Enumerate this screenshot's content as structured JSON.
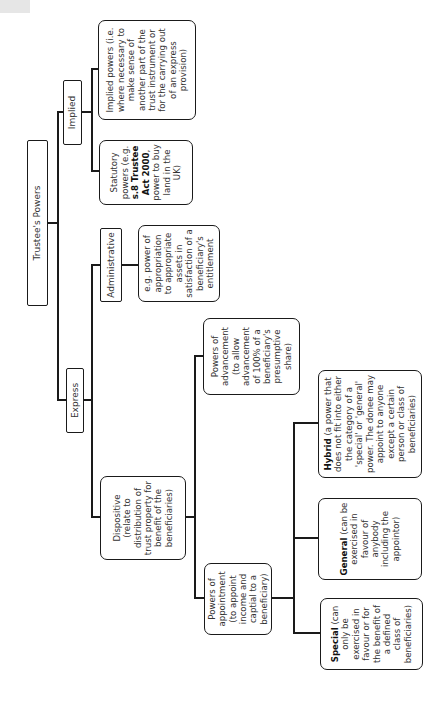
{
  "diagram": {
    "title": "Trustee's Powers",
    "orientation": "rotated -90deg (text reads bottom-to-top)",
    "root": {
      "label": "Trustee's Powers",
      "children": {
        "express": {
          "label": "Express",
          "administrative": {
            "label": "Administrative",
            "detail": "e.g. power of appropriation to appropriate assets in satisfaction of a beneficiary's entitlement"
          },
          "dispositive": {
            "label": "Dispositive (relate to distribution of trust property for benefit of the beneficiaries)",
            "appointment": {
              "label": "Powers of appointment (to appoint income and captial to a beneficiary)",
              "special": {
                "bold": "Special",
                "rest": " (can only be exercised in favour or for the benefit of a defined class of beneficiaries)"
              },
              "general": {
                "bold": "General",
                "rest": " (can be exercised in favour of anybody including the appointor)"
              },
              "hybrid": {
                "bold": "Hybrid",
                "rest": " (a power that does not fit into either the category of a 'special' or 'general' power. The donee may appoint to anyone except a certain person or class of beneficiaries)"
              }
            },
            "advancement": {
              "label": "Powers of advancement (to allow advancement of 100% of a beneficiary's presumptive share)"
            }
          }
        },
        "implied": {
          "label": "Implied",
          "statutory": {
            "pre": "Statutory powers (e.g. ",
            "bold": "s.8 Trustee Act 2000",
            "post": ", power to buy land in the UK)"
          },
          "implied_detail": "Implied powers (i.e. where necessary to make sense of another part of the trust instrument or for the carrying out of an express provision)"
        }
      }
    }
  }
}
